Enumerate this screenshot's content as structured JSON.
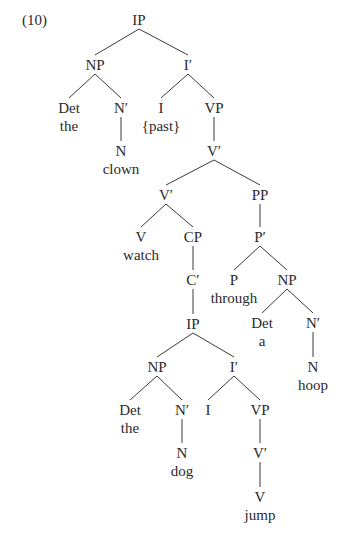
{
  "example_number": "(10)",
  "tree": {
    "nodes": [
      {
        "id": "ip1",
        "label": "IP",
        "x": 139,
        "y": 12
      },
      {
        "id": "np1",
        "label": "NP",
        "x": 95,
        "y": 57
      },
      {
        "id": "ibar1",
        "label": "I′",
        "x": 188,
        "y": 57
      },
      {
        "id": "det1",
        "label": "Det",
        "word": "the",
        "x": 69,
        "y": 100
      },
      {
        "id": "nbar1",
        "label": "N′",
        "x": 121,
        "y": 100
      },
      {
        "id": "i1",
        "label": "I",
        "word": "{past}",
        "x": 161,
        "y": 100
      },
      {
        "id": "vp1",
        "label": "VP",
        "x": 214,
        "y": 100
      },
      {
        "id": "n1",
        "label": "N",
        "word": "clown",
        "x": 121,
        "y": 143
      },
      {
        "id": "vbar1",
        "label": "V′",
        "x": 214,
        "y": 143
      },
      {
        "id": "vbar2",
        "label": "V′",
        "x": 166,
        "y": 187
      },
      {
        "id": "pp1",
        "label": "PP",
        "x": 260,
        "y": 187
      },
      {
        "id": "v1",
        "label": "V",
        "word": "watch",
        "x": 141,
        "y": 229
      },
      {
        "id": "cp1",
        "label": "CP",
        "x": 193,
        "y": 229
      },
      {
        "id": "pbar1",
        "label": "P′",
        "x": 260,
        "y": 229
      },
      {
        "id": "cbar1",
        "label": "C′",
        "x": 193,
        "y": 272
      },
      {
        "id": "p1",
        "label": "P",
        "word": "through",
        "x": 234,
        "y": 272
      },
      {
        "id": "np2",
        "label": "NP",
        "x": 287,
        "y": 272
      },
      {
        "id": "ip2",
        "label": "IP",
        "x": 193,
        "y": 316
      },
      {
        "id": "det2",
        "label": "Det",
        "word": "a",
        "x": 262,
        "y": 315
      },
      {
        "id": "nbar2",
        "label": "N′",
        "x": 313,
        "y": 315
      },
      {
        "id": "np3",
        "label": "NP",
        "x": 157,
        "y": 359
      },
      {
        "id": "ibar2",
        "label": "I′",
        "x": 234,
        "y": 359
      },
      {
        "id": "n2",
        "label": "N",
        "word": "hoop",
        "x": 313,
        "y": 359
      },
      {
        "id": "det3",
        "label": "Det",
        "word": "the",
        "x": 130,
        "y": 402
      },
      {
        "id": "nbar3",
        "label": "N′",
        "x": 182,
        "y": 402
      },
      {
        "id": "i2",
        "label": "I",
        "x": 208,
        "y": 402
      },
      {
        "id": "vp2",
        "label": "VP",
        "x": 260,
        "y": 402
      },
      {
        "id": "n3",
        "label": "N",
        "word": "dog",
        "x": 182,
        "y": 445
      },
      {
        "id": "vbar3",
        "label": "V′",
        "x": 260,
        "y": 445
      },
      {
        "id": "v2",
        "label": "V",
        "word": "jump",
        "x": 260,
        "y": 489
      }
    ],
    "edges": [
      [
        "ip1",
        "np1"
      ],
      [
        "ip1",
        "ibar1"
      ],
      [
        "np1",
        "det1"
      ],
      [
        "np1",
        "nbar1"
      ],
      [
        "ibar1",
        "i1"
      ],
      [
        "ibar1",
        "vp1"
      ],
      [
        "nbar1",
        "n1"
      ],
      [
        "vp1",
        "vbar1"
      ],
      [
        "vbar1",
        "vbar2"
      ],
      [
        "vbar1",
        "pp1"
      ],
      [
        "vbar2",
        "v1"
      ],
      [
        "vbar2",
        "cp1"
      ],
      [
        "pp1",
        "pbar1"
      ],
      [
        "cp1",
        "cbar1"
      ],
      [
        "pbar1",
        "p1"
      ],
      [
        "pbar1",
        "np2"
      ],
      [
        "cbar1",
        "ip2"
      ],
      [
        "np2",
        "det2"
      ],
      [
        "np2",
        "nbar2"
      ],
      [
        "ip2",
        "np3"
      ],
      [
        "ip2",
        "ibar2"
      ],
      [
        "nbar2",
        "n2"
      ],
      [
        "np3",
        "det3"
      ],
      [
        "np3",
        "nbar3"
      ],
      [
        "ibar2",
        "i2"
      ],
      [
        "ibar2",
        "vp2"
      ],
      [
        "nbar3",
        "n3"
      ],
      [
        "vp2",
        "vbar3"
      ],
      [
        "vbar3",
        "v2"
      ]
    ]
  },
  "colors": {
    "line": "#3a3a3a",
    "text": "#2a2a2a",
    "background": "#ffffff"
  }
}
